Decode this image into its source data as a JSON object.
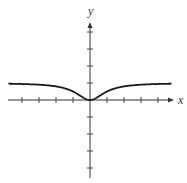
{
  "chart_data": {
    "type": "line",
    "title": "",
    "xlabel": "x",
    "ylabel": "y",
    "function": "y = x^2 / (1 + x^2)",
    "xlim": [
      -4.8,
      4.8
    ],
    "ylim": [
      -4,
      4.5
    ],
    "grid": false,
    "legend": null,
    "x_ticks": [
      -4,
      -3,
      -2,
      -1,
      1,
      2,
      3,
      4
    ],
    "y_ticks": [
      -4,
      -3,
      -2,
      -1,
      1,
      2,
      3,
      4
    ],
    "tick_labels_shown": false,
    "asymptote": {
      "y": 1
    },
    "series": [
      {
        "name": "curve",
        "x": [
          -4.8,
          -4,
          -3,
          -2,
          -1.5,
          -1,
          -0.5,
          0,
          0.5,
          1,
          1.5,
          2,
          3,
          4,
          4.8
        ],
        "y": [
          0.958,
          0.941,
          0.9,
          0.8,
          0.692,
          0.5,
          0.2,
          0,
          0.2,
          0.5,
          0.692,
          0.8,
          0.9,
          0.941,
          0.958
        ]
      }
    ]
  },
  "layout": {
    "origin_px": [
      90,
      100
    ],
    "unit_px": 17,
    "x_axis_px": [
      8,
      174
    ],
    "y_axis_px": [
      22,
      178
    ],
    "x_label_px": [
      178,
      104
    ],
    "y_label_px": [
      88,
      15
    ]
  }
}
